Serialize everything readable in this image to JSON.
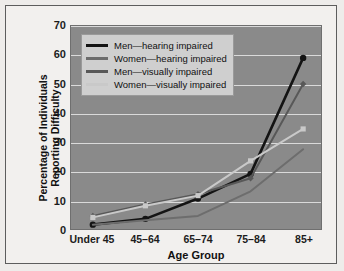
{
  "chart_data": {
    "type": "line",
    "title": "",
    "xlabel": "Age Group",
    "ylabel": "Percentage of Individuals Reporting Difficulty",
    "ylabel_line1": "Percentage of Individuals",
    "ylabel_line2": "Reporting Difficulty",
    "categories": [
      "Under 45",
      "45–64",
      "65–74",
      "75–84",
      "85+"
    ],
    "ylim": [
      0,
      70
    ],
    "ytick_values": [
      0,
      10,
      20,
      30,
      40,
      50,
      60,
      70
    ],
    "grid": true,
    "legend_position": "upper-left-inside",
    "series": [
      {
        "name": "Men—hearing impaired",
        "color": "#141414",
        "marker": "circle",
        "values": [
          1.5,
          3.5,
          10.5,
          19,
          59
        ]
      },
      {
        "name": "Women—hearing impaired",
        "color": "#6d6d6d",
        "marker": "none",
        "values": [
          1.5,
          3,
          4.5,
          13,
          27.5
        ]
      },
      {
        "name": "Men—visually impaired",
        "color": "#585858",
        "marker": "diamond",
        "values": [
          4.5,
          8.5,
          12,
          17.5,
          50
        ]
      },
      {
        "name": "Women—visually impaired",
        "color": "#c9c9c9",
        "marker": "square",
        "values": [
          4,
          8,
          11.5,
          23.5,
          34.5
        ]
      }
    ]
  },
  "legend": {
    "items": [
      {
        "label": "Men—hearing impaired",
        "color": "#141414"
      },
      {
        "label": "Women—hearing impaired",
        "color": "#6d6d6d"
      },
      {
        "label": "Men—visually impaired",
        "color": "#585858"
      },
      {
        "label": "Women—visually impaired",
        "color": "#c9c9c9"
      }
    ]
  },
  "style": {
    "plot_background": "#8a8a8a",
    "page_background": "#f2f0ee",
    "gridline_color": "#e8e8e8",
    "legend_background": "#cfcfcf",
    "axis_text_color": "#111111"
  }
}
